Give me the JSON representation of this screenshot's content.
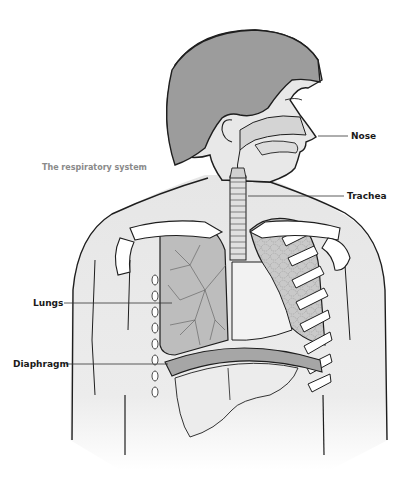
{
  "diagram": {
    "title": "The respiratory system",
    "labels": {
      "nose": "Nose",
      "trachea": "Trachea",
      "lungs": "Lungs",
      "diaphragm": "Diaphragm"
    }
  },
  "colors": {
    "background": "#ffffff",
    "hair": "#9a9a9a",
    "skin": "#e8e8e8",
    "lung_fill": "#c4c4c4",
    "diaphragm": "#a8a8a8",
    "outline": "#1e1e1e",
    "bone": "#ffffff",
    "title_text": "#8a8a8a",
    "label_text": "#1a1a1a"
  }
}
